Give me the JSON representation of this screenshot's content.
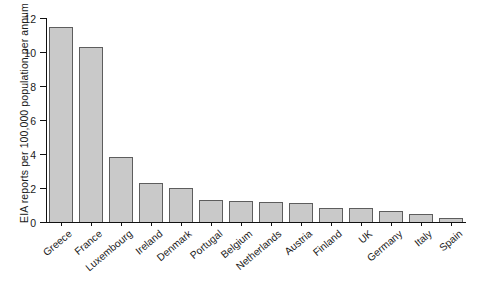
{
  "chart_data": {
    "type": "bar",
    "title": "",
    "xlabel": "",
    "ylabel": "EIA reports per 100,000 population per annum",
    "ylim": [
      0,
      12
    ],
    "ytick_labels": [
      "0",
      "2",
      "4",
      "6",
      "8",
      "10",
      "12"
    ],
    "ytick_values": [
      0,
      2,
      4,
      6,
      8,
      10,
      12
    ],
    "grid": false,
    "legend": false,
    "categories": [
      "Greece",
      "France",
      "Luxembourg",
      "Ireland",
      "Denmark",
      "Portugal",
      "Belgium",
      "Netherlands",
      "Austria",
      "Finland",
      "UK",
      "Germany",
      "Italy",
      "Spain"
    ],
    "values": [
      11.5,
      10.3,
      3.8,
      2.3,
      2.0,
      1.3,
      1.25,
      1.15,
      1.1,
      0.8,
      0.8,
      0.65,
      0.5,
      0.25
    ],
    "bar_fill_color": "#c9c9c9",
    "bar_edge_color": "#5d5d5d",
    "axis_color": "#111111",
    "background_color": "#ffffff"
  }
}
